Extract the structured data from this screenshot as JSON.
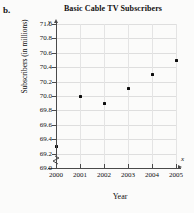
{
  "panel": {
    "label": "b."
  },
  "chart_data": {
    "type": "scatter",
    "title": "Basic Cable TV Subscribers",
    "xlabel": "Year",
    "ylabel": "Subscribers (in millions)",
    "x_axis_variable": "x",
    "y_axis_variable": "y",
    "categories": [
      2000,
      2001,
      2002,
      2003,
      2004,
      2005
    ],
    "x_tick_labels": [
      "2000",
      "2001",
      "2002",
      "2003",
      "2004",
      "2005"
    ],
    "values": [
      69.3,
      70.0,
      69.9,
      70.1,
      70.3,
      70.5
    ],
    "y_tick_labels": [
      "69.0",
      "69.2",
      "69.4",
      "69.6",
      "69.8",
      "70.0",
      "70.2",
      "70.4",
      "70.6",
      "70.8",
      "71.0"
    ],
    "y_ticks": [
      69.0,
      69.2,
      69.4,
      69.6,
      69.8,
      70.0,
      70.2,
      70.4,
      70.6,
      70.8,
      71.0
    ],
    "ylim": [
      69.0,
      71.0
    ],
    "xlim": [
      2000,
      2005
    ],
    "grid": true,
    "legend": "none",
    "y_axis_break": true,
    "marker_color": "#0d0d0d",
    "grid_color": "#dedede",
    "axis_color": "#4a4a4a"
  }
}
